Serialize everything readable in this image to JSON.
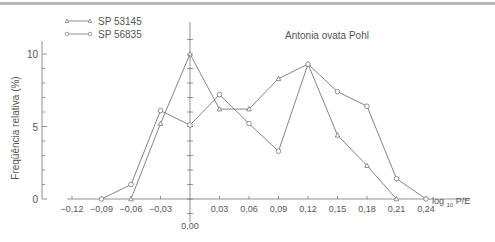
{
  "chart_data": {
    "type": "line",
    "title": "Antonia ovata Pohl",
    "xlabel": "log 10 P/E",
    "xlabel_main": "log",
    "xlabel_sub": "10",
    "xlabel_tail": "P/E",
    "ylabel": "Freqüência relativa (%)",
    "ylim": [
      0,
      10
    ],
    "xlim": [
      -0.12,
      0.24
    ],
    "grid": false,
    "legend_position": "top-left",
    "y_ticks": [
      "0",
      "5",
      "10"
    ],
    "x_tick_labels": [
      "-0,12",
      "-0,09",
      "-0,06",
      "-0,03",
      "0,00",
      "0,03",
      "0,06",
      "0,09",
      "0,12",
      "0,15",
      "0,18",
      "0,21",
      "0,24"
    ],
    "series": [
      {
        "name": "SP 53145",
        "marker": "triangle",
        "x": [
          -0.06,
          -0.03,
          0.0,
          0.03,
          0.06,
          0.09,
          0.12,
          0.15,
          0.18,
          0.21
        ],
        "values": [
          0,
          5.2,
          10,
          6.2,
          6.2,
          8.3,
          9.3,
          4.4,
          2.3,
          0
        ]
      },
      {
        "name": "SP 56835",
        "marker": "circle",
        "x": [
          -0.09,
          -0.06,
          -0.03,
          0.0,
          0.03,
          0.06,
          0.09,
          0.12,
          0.15,
          0.18,
          0.21,
          0.24
        ],
        "values": [
          0,
          1,
          6.1,
          5.1,
          7.2,
          5.2,
          3.3,
          9.3,
          7.4,
          6.4,
          1.4,
          0
        ]
      }
    ]
  }
}
